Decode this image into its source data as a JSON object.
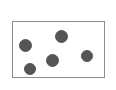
{
  "figure": {
    "title": "",
    "background_color": "#ffffff",
    "width": 116,
    "height": 90
  },
  "frame": {
    "name": "plot-frame",
    "x": 12,
    "y": 21,
    "width": 93,
    "height": 57,
    "border_color": "#8c8c8c",
    "border_width": 1.5,
    "fill_color": "#ffffff"
  },
  "chart_data": {
    "type": "scatter",
    "title": "",
    "xlabel": "",
    "ylabel": "",
    "grid": false,
    "legend": null,
    "axis_ticks": false,
    "marker": {
      "shape": "circle",
      "color": "#555555",
      "edge_color": "#555555",
      "diameter_px": 12
    },
    "point_count": 5,
    "points": [
      {
        "id": "point-1",
        "cx": 25,
        "cy": 45,
        "r": 6.5
      },
      {
        "id": "point-2",
        "cx": 61,
        "cy": 36,
        "r": 6.5
      },
      {
        "id": "point-3",
        "cx": 52,
        "cy": 60,
        "r": 6.5
      },
      {
        "id": "point-4",
        "cx": 87,
        "cy": 56,
        "r": 6.0
      },
      {
        "id": "point-5",
        "cx": 30,
        "cy": 69,
        "r": 6.0
      }
    ]
  }
}
